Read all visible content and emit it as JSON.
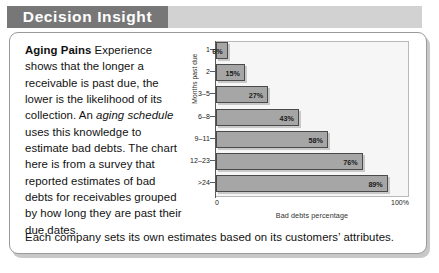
{
  "banner": {
    "title": "Decision Insight"
  },
  "body": {
    "lead": "Aging Pains",
    "paragraph_part1": " Experience shows that the longer a receivable is past due, the lower is the likelihood of its collection. An ",
    "italic_term": "aging schedule",
    "paragraph_part2": " uses this knowledge to estimate bad debts. The chart here is from a survey that reported estimates of bad debts for receivables grouped by how long they are past their due dates.",
    "closing": "Each company sets its own estimates based on its customers’ attributes."
  },
  "chart_data": {
    "type": "bar",
    "orientation": "horizontal",
    "title": "",
    "xlabel": "Bad debts percentage",
    "ylabel": "Months past due",
    "categories": [
      "1",
      "2",
      "3–5",
      "6–8",
      "9–11",
      "12–23",
      ">24"
    ],
    "values": [
      6,
      15,
      27,
      43,
      58,
      76,
      89
    ],
    "value_labels": [
      "6%",
      "15%",
      "27%",
      "43%",
      "58%",
      "76%",
      "89%"
    ],
    "xlim": [
      0,
      100
    ],
    "xtick_labels": [
      "0",
      "100%"
    ],
    "grid": false,
    "legend": null,
    "bar_color": "#a6a6a6",
    "bar_border_color": "#4a4a4a",
    "plot_background": "#f6f6f6"
  },
  "colors": {
    "banner_dark": "#777777",
    "banner_light": "#d2d2d2",
    "card_border": "#9a9a9a",
    "text": "#111111"
  }
}
